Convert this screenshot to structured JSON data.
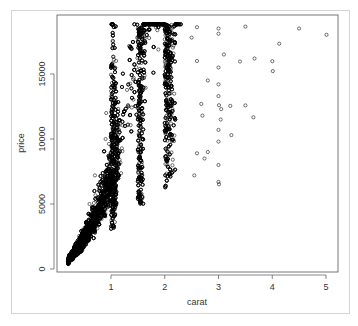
{
  "chart_data": {
    "type": "scatter",
    "title": "",
    "xlabel": "carat",
    "ylabel": "price",
    "xlim": [
      0.2,
      5.01
    ],
    "ylim": [
      326,
      18823
    ],
    "x_ticks": [
      1,
      2,
      3,
      4,
      5
    ],
    "y_ticks": [
      0,
      5000,
      10000,
      15000
    ],
    "x_tick_labels": [
      "1",
      "2",
      "3",
      "4",
      "5"
    ],
    "y_tick_labels": [
      "0",
      "5000",
      "10000",
      "15000"
    ],
    "grid": false,
    "legend": null,
    "marker": "open-circle",
    "marker_color": "#000000",
    "dense_regions": [
      {
        "x_min": 0.2,
        "x_max": 0.5,
        "y_min": 326,
        "y_max": 2500
      },
      {
        "x_min": 0.5,
        "x_max": 1.0,
        "y_min": 1000,
        "y_max": 7000
      },
      {
        "x_min": 1.0,
        "x_max": 1.5,
        "y_min": 2500,
        "y_max": 18800
      },
      {
        "x_min": 1.5,
        "x_max": 2.0,
        "y_min": 5000,
        "y_max": 18800
      },
      {
        "x_min": 2.0,
        "x_max": 2.5,
        "y_min": 6000,
        "y_max": 18800
      }
    ],
    "outliers": [
      {
        "x": 2.6,
        "y": 18600
      },
      {
        "x": 3.0,
        "y": 18500
      },
      {
        "x": 3.0,
        "y": 18100
      },
      {
        "x": 3.5,
        "y": 18650
      },
      {
        "x": 4.5,
        "y": 18500
      },
      {
        "x": 5.01,
        "y": 18018
      },
      {
        "x": 4.13,
        "y": 17329
      },
      {
        "x": 3.67,
        "y": 16193
      },
      {
        "x": 3.4,
        "y": 15964
      },
      {
        "x": 3.1,
        "y": 16500
      },
      {
        "x": 3.0,
        "y": 15500
      },
      {
        "x": 3.0,
        "y": 14200
      },
      {
        "x": 3.0,
        "y": 13300
      },
      {
        "x": 3.01,
        "y": 12600
      },
      {
        "x": 3.22,
        "y": 12545
      },
      {
        "x": 3.05,
        "y": 12300
      },
      {
        "x": 3.5,
        "y": 12587
      },
      {
        "x": 3.65,
        "y": 11668
      },
      {
        "x": 4.0,
        "y": 15984
      },
      {
        "x": 4.01,
        "y": 15223
      },
      {
        "x": 3.24,
        "y": 10300
      },
      {
        "x": 3.0,
        "y": 10700
      },
      {
        "x": 3.0,
        "y": 9800
      },
      {
        "x": 3.0,
        "y": 8000
      },
      {
        "x": 2.8,
        "y": 9000
      },
      {
        "x": 3.0,
        "y": 6700
      },
      {
        "x": 3.01,
        "y": 6512
      },
      {
        "x": 2.74,
        "y": 8500
      },
      {
        "x": 2.55,
        "y": 7200
      },
      {
        "x": 2.6,
        "y": 8900
      },
      {
        "x": 2.7,
        "y": 11800
      },
      {
        "x": 2.8,
        "y": 14500
      },
      {
        "x": 2.6,
        "y": 16000
      },
      {
        "x": 2.5,
        "y": 17800
      },
      {
        "x": 2.68,
        "y": 12700
      },
      {
        "x": 3.04,
        "y": 11500
      },
      {
        "x": 0.9,
        "y": 10000
      },
      {
        "x": 0.7,
        "y": 7200
      },
      {
        "x": 0.6,
        "y": 5000
      },
      {
        "x": 0.91,
        "y": 12000
      }
    ]
  },
  "axes": {
    "x_title": "carat",
    "y_title": "price"
  }
}
